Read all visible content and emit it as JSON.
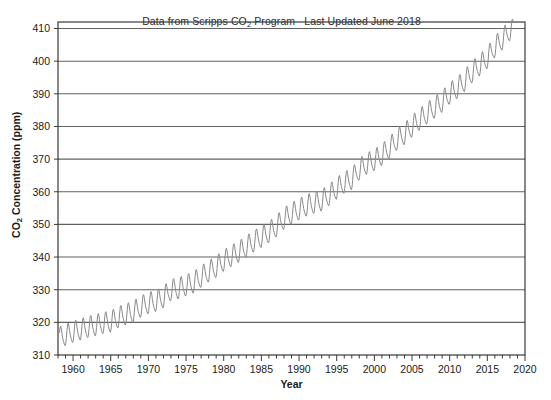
{
  "chart_data": {
    "type": "line",
    "title": "Data from Scripps CO2 Program   Last Updated June 2018",
    "title_parts": {
      "lead": "Data from Scripps CO",
      "sub": "2",
      "tail": " Program",
      "updated": "Last Updated June 2018"
    },
    "xlabel": "Year",
    "ylabel": "CO2 Concentration (ppm)",
    "ylabel_parts": {
      "lead": "CO",
      "sub": "2",
      "tail": " Concentration (ppm)"
    },
    "xlim": [
      1958,
      2020
    ],
    "ylim": [
      310,
      412
    ],
    "xticks": [
      1960,
      1965,
      1970,
      1975,
      1980,
      1985,
      1990,
      1995,
      2000,
      2005,
      2010,
      2015,
      2020
    ],
    "yticks": [
      310,
      320,
      330,
      340,
      350,
      360,
      370,
      380,
      390,
      400,
      410
    ],
    "xminor_step": 1,
    "grid": "horizontal",
    "legend": "none",
    "line_color": "#8a8a8a",
    "axis_color": "#3a3a3a",
    "grid_color": "#606060",
    "background": "#ffffff",
    "series": [
      {
        "name": "Atmospheric CO2 concentration (Mauna Loa, monthly mean)",
        "seasonal_amplitude_ppm": 3.1,
        "seasonal_peak_month": 5,
        "annual_mean": {
          "years": [
            1958,
            1959,
            1960,
            1961,
            1962,
            1963,
            1964,
            1965,
            1966,
            1967,
            1968,
            1969,
            1970,
            1971,
            1972,
            1973,
            1974,
            1975,
            1976,
            1977,
            1978,
            1979,
            1980,
            1981,
            1982,
            1983,
            1984,
            1985,
            1986,
            1987,
            1988,
            1989,
            1990,
            1991,
            1992,
            1993,
            1994,
            1995,
            1996,
            1997,
            1998,
            1999,
            2000,
            2001,
            2002,
            2003,
            2004,
            2005,
            2006,
            2007,
            2008,
            2009,
            2010,
            2011,
            2012,
            2013,
            2014,
            2015,
            2016,
            2017,
            2018
          ],
          "values": [
            315.0,
            315.9,
            316.9,
            317.6,
            318.4,
            318.9,
            319.6,
            320.0,
            321.4,
            322.2,
            323.0,
            324.6,
            325.7,
            326.3,
            327.5,
            329.7,
            330.2,
            331.1,
            332.0,
            333.8,
            335.4,
            336.8,
            338.7,
            340.1,
            341.4,
            343.0,
            344.6,
            346.0,
            347.4,
            349.2,
            351.6,
            353.1,
            354.4,
            355.6,
            356.4,
            357.1,
            358.8,
            360.8,
            362.6,
            363.7,
            366.7,
            368.4,
            369.5,
            371.1,
            373.2,
            375.8,
            377.5,
            379.8,
            381.9,
            383.8,
            385.6,
            387.4,
            389.9,
            391.6,
            393.8,
            396.5,
            398.6,
            400.8,
            404.2,
            406.5,
            409.4
          ]
        },
        "reference_points": [
          {
            "year": 1958,
            "ppm": 315.0
          },
          {
            "year": 1970,
            "ppm": 325.7
          },
          {
            "year": 1980,
            "ppm": 338.7
          },
          {
            "year": 1990,
            "ppm": 354.4
          },
          {
            "year": 2000,
            "ppm": 369.5
          },
          {
            "year": 2010,
            "ppm": 389.9
          },
          {
            "year": 2018,
            "ppm": 409.4
          }
        ],
        "max_observed_ppm": 411.3,
        "min_observed_ppm": 312.4
      }
    ]
  }
}
